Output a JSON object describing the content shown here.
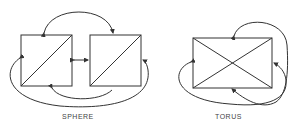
{
  "diagrams": [
    {
      "id": "sphere",
      "label": "SPHERE"
    },
    {
      "id": "torus",
      "label": "TORUS"
    }
  ],
  "colors": {
    "stroke": "#333333",
    "background": "#ffffff"
  }
}
